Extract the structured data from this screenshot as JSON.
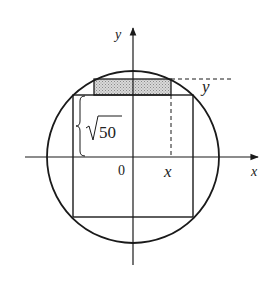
{
  "diagram": {
    "labels": {
      "y_axis": "y",
      "x_axis": "x",
      "origin": "0",
      "x_point": "x",
      "y_point": "y",
      "half_side_radicand": "50"
    },
    "colors": {
      "stroke": "#1a1a1a",
      "shade": "#c8c8c8",
      "background": "#ffffff"
    }
  }
}
